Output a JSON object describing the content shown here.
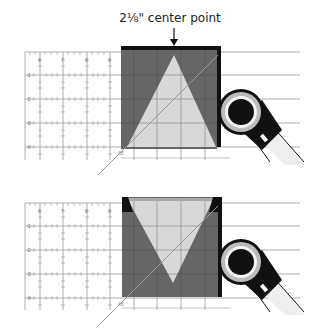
{
  "caption": "2⅛\" center point",
  "colors": {
    "background": "#ffffff",
    "ruler_grid": "#9a9a9a",
    "fabric_dark": "#666666",
    "fabric_light": "#d8d8d8",
    "frame_black": "#111111",
    "cutter_handle": "#111111"
  },
  "panels": [
    {
      "id": "top",
      "ruler_top_labels": [
        "6",
        "7",
        "8",
        "9"
      ],
      "ruler_side_labels": [
        "1",
        "2",
        "3",
        "4"
      ],
      "angle_label": "45",
      "triangle_orientation": "point-up"
    },
    {
      "id": "bottom",
      "ruler_top_labels": [
        "6",
        "7",
        "8",
        "9"
      ],
      "ruler_side_labels": [
        "1",
        "2",
        "3",
        "4"
      ],
      "angle_label": "45",
      "triangle_orientation": "point-down"
    }
  ]
}
